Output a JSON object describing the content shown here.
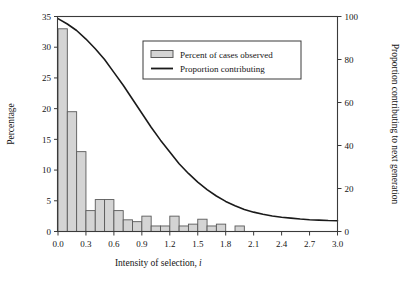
{
  "chart_data": {
    "type": "bar",
    "title": "",
    "subtitle": "",
    "xlabel": "Intensity of selection, i",
    "xlabel_plain": "Intensity of selection,",
    "xlabel_italic": "i",
    "ylabel": "Percentage",
    "y2label": "Proportion contributing to next generation",
    "xlim": [
      0.0,
      3.0
    ],
    "ylim": [
      0,
      35
    ],
    "y2lim": [
      0,
      100
    ],
    "grid": false,
    "legend_position": "top-center-right",
    "x_ticks": [
      "0.0",
      "0.3",
      "0.6",
      "0.9",
      "1.2",
      "1.5",
      "1.8",
      "2.1",
      "2.4",
      "2.7",
      "3.0"
    ],
    "x_tick_values": [
      0.0,
      0.3,
      0.6,
      0.9,
      1.2,
      1.5,
      1.8,
      2.1,
      2.4,
      2.7,
      3.0
    ],
    "y_ticks": [
      "0",
      "5",
      "10",
      "15",
      "20",
      "25",
      "30",
      "35"
    ],
    "y_tick_values": [
      0,
      5,
      10,
      15,
      20,
      25,
      30,
      35
    ],
    "y2_ticks": [
      "0",
      "20",
      "40",
      "60",
      "80",
      "100"
    ],
    "y2_tick_values": [
      0,
      20,
      40,
      60,
      80,
      100
    ],
    "bar_width": 0.1,
    "bar_fill": "#d4d4d4",
    "bar_stroke": "#5a5a5a",
    "line_color": "#1a1a1a",
    "frame_color": "#3a3a3a",
    "background": "#ffffff",
    "categories": [
      0.05,
      0.15,
      0.25,
      0.35,
      0.45,
      0.55,
      0.65,
      0.75,
      0.85,
      0.95,
      1.05,
      1.15,
      1.25,
      1.35,
      1.45,
      1.55,
      1.65,
      1.75,
      1.85,
      1.95
    ],
    "series": [
      {
        "name": "Percent of cases observed",
        "type": "bar",
        "axis": "left",
        "values": [
          33.0,
          19.5,
          13.0,
          3.4,
          5.2,
          5.2,
          3.4,
          1.9,
          1.6,
          2.5,
          0.9,
          0.9,
          2.5,
          0.9,
          1.2,
          2.0,
          0.9,
          1.2,
          0.0,
          0.9
        ]
      },
      {
        "name": "Proportion contributing",
        "type": "line",
        "axis": "right",
        "x": [
          0.0,
          0.1,
          0.2,
          0.3,
          0.4,
          0.5,
          0.6,
          0.7,
          0.8,
          0.9,
          1.0,
          1.1,
          1.2,
          1.3,
          1.4,
          1.5,
          1.6,
          1.7,
          1.8,
          1.9,
          2.0,
          2.1,
          2.2,
          2.3,
          2.4,
          2.5,
          2.6,
          2.7,
          2.8,
          2.9,
          3.0
        ],
        "values": [
          99.0,
          96.5,
          93.5,
          89.5,
          85.0,
          80.0,
          74.0,
          68.0,
          61.5,
          55.0,
          48.5,
          42.5,
          37.0,
          31.5,
          27.0,
          23.0,
          19.5,
          16.5,
          14.0,
          12.0,
          10.2,
          9.0,
          8.0,
          7.2,
          6.6,
          6.2,
          5.8,
          5.5,
          5.3,
          5.1,
          5.0
        ]
      }
    ],
    "legend": [
      {
        "label": "Percent of cases observed",
        "marker": "bar-swatch"
      },
      {
        "label": "Proportion contributing",
        "marker": "line-swatch"
      }
    ]
  }
}
